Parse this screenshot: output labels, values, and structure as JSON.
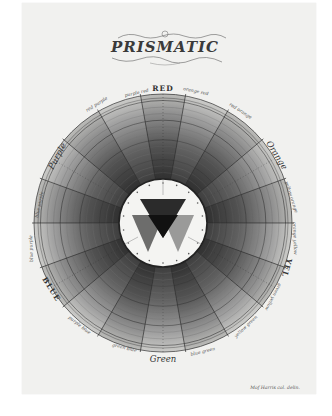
{
  "plate": {
    "title": "PRISMATIC",
    "signature": "Mof Harris col. delin."
  },
  "wheel": {
    "center": [
      163,
      223
    ],
    "outer_radius": 129,
    "inner_radius": 44,
    "segments": 18,
    "rings": 12,
    "labels": {
      "red": "RED",
      "red_purple": "red purple",
      "purple_red": "purple red",
      "orange_red": "orange red",
      "red_orange": "red orange",
      "orange": "Orange",
      "yellow_orange": "yellow orange",
      "orange_yellow": "orange yellow",
      "yellow": "YEL",
      "green_yellow": "green yellow",
      "yellow_green": "yellow green",
      "green": "Green",
      "blue_green": "blue green",
      "green_blue": "green blue",
      "blue": "BLUE",
      "purple_blue": "purple blue",
      "blue_purple": "blue purple",
      "purple": "Purple"
    }
  },
  "colors": {
    "paper": "#f1f1ef",
    "ink_dark": "#2a2a2a",
    "ink_mid": "#6e6e6e",
    "ink_light": "#b8b8b8",
    "center_disk": "#f4f4f2"
  }
}
